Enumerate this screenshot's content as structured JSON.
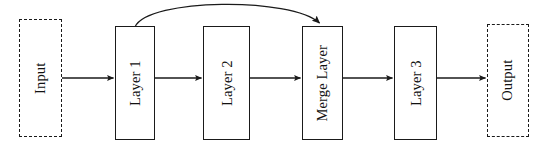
{
  "diagram": {
    "type": "block-flow-diagram",
    "canvas": {
      "width": 546,
      "height": 151,
      "background": "#ffffff"
    },
    "stroke_color": "#1a1a1a",
    "text_color": "#111111",
    "label_orientation": "rotated-90-ccw",
    "nodes": [
      {
        "id": "input",
        "label": "Input",
        "style": "dashed",
        "x": 19,
        "y": 19,
        "width": 43,
        "height": 118
      },
      {
        "id": "layer1",
        "label": "Layer 1",
        "style": "solid",
        "x": 115,
        "y": 26,
        "width": 40,
        "height": 114
      },
      {
        "id": "layer2",
        "label": "Layer 2",
        "style": "solid",
        "x": 203,
        "y": 26,
        "width": 47,
        "height": 114
      },
      {
        "id": "merge",
        "label": "Merge Layer",
        "style": "solid",
        "x": 302,
        "y": 26,
        "width": 41,
        "height": 114
      },
      {
        "id": "layer3",
        "label": "Layer 3",
        "style": "solid",
        "x": 394,
        "y": 26,
        "width": 43,
        "height": 114
      },
      {
        "id": "output",
        "label": "Output",
        "style": "dashed",
        "x": 487,
        "y": 24,
        "width": 42,
        "height": 113
      }
    ],
    "edges": [
      {
        "id": "input-to-layer1",
        "from": "input",
        "to": "layer1",
        "kind": "straight",
        "x1": 62,
        "y1": 78,
        "x2": 114,
        "y2": 78
      },
      {
        "id": "layer1-to-layer2",
        "from": "layer1",
        "to": "layer2",
        "kind": "straight",
        "x1": 155,
        "y1": 78,
        "x2": 202,
        "y2": 78
      },
      {
        "id": "layer2-to-merge",
        "from": "layer2",
        "to": "merge",
        "kind": "straight",
        "x1": 250,
        "y1": 78,
        "x2": 301,
        "y2": 78
      },
      {
        "id": "merge-to-layer3",
        "from": "merge",
        "to": "layer3",
        "kind": "straight",
        "x1": 343,
        "y1": 78,
        "x2": 393,
        "y2": 78
      },
      {
        "id": "layer3-to-output",
        "from": "layer3",
        "to": "output",
        "kind": "straight",
        "x1": 437,
        "y1": 78,
        "x2": 486,
        "y2": 78
      },
      {
        "id": "layer1-to-merge-skip",
        "from": "layer1",
        "to": "merge",
        "kind": "curved",
        "label": "skip connection",
        "path": "M 135 26 C 150 -1 290 -1 320 24"
      }
    ]
  }
}
